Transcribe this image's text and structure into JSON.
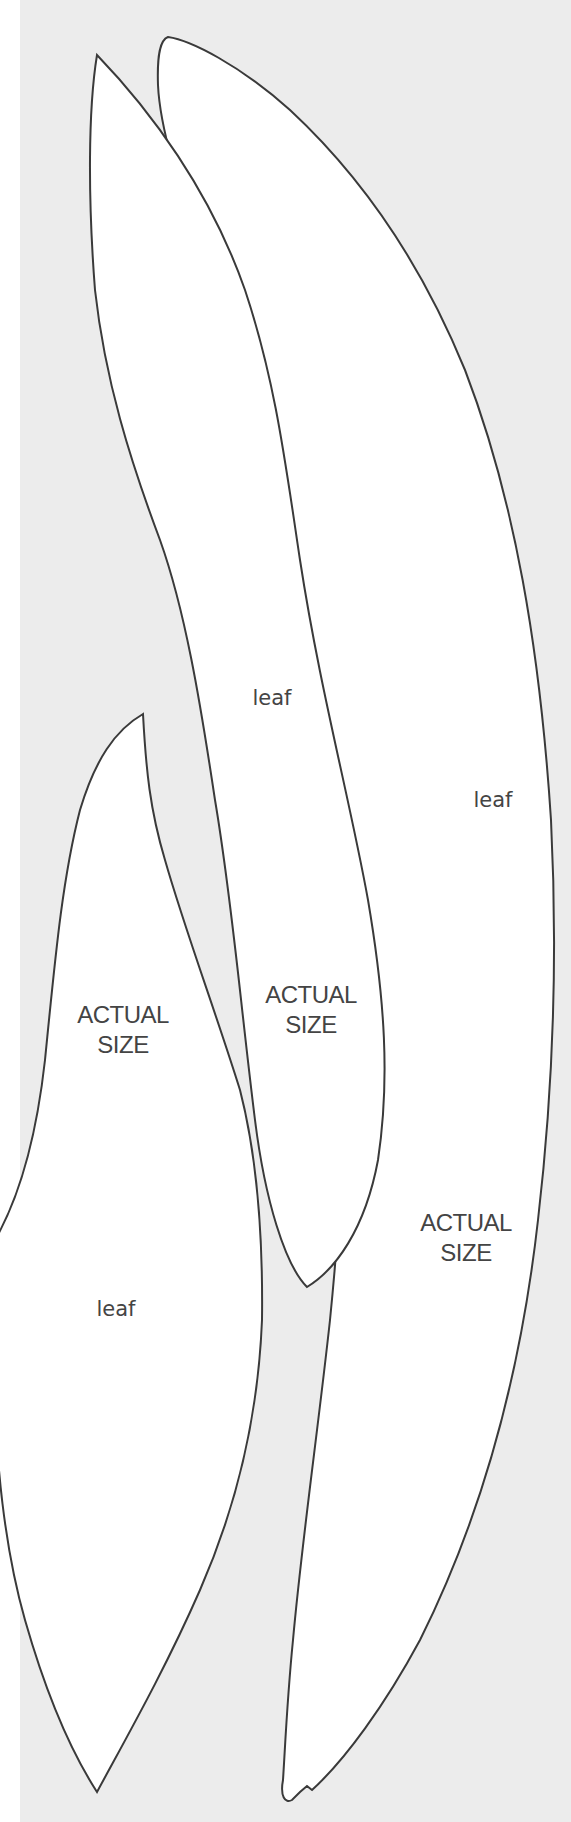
{
  "page": {
    "background_color": "#ececec",
    "margin_color": "#ffffff",
    "leaf_fill": "#ffffff",
    "outline_color": "#3a3a3a"
  },
  "leaves": [
    {
      "id": "middle-leaf",
      "name_label": "leaf",
      "size_label_line1": "ACTUAL",
      "size_label_line2": "SIZE"
    },
    {
      "id": "right-leaf",
      "name_label": "leaf",
      "size_label_line1": "ACTUAL",
      "size_label_line2": "SIZE"
    },
    {
      "id": "left-leaf",
      "name_label": "leaf",
      "size_label_line1": "ACTUAL",
      "size_label_line2": "SIZE"
    }
  ]
}
